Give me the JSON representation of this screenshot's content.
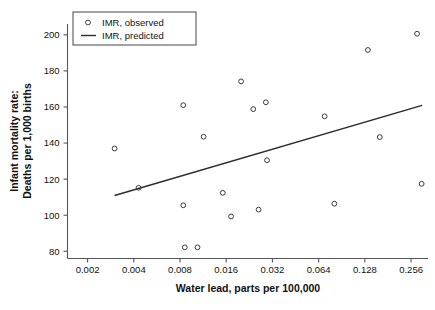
{
  "chart_data": {
    "type": "scatter",
    "title": "",
    "xlabel": "Water lead, parts per 100,000",
    "ylabel": "Infant mortality rate:\nDeaths per 1,000 births",
    "ylabel_line1": "Infant mortality rate:",
    "ylabel_line2": "Deaths per 1,000 births",
    "xscale": "log2",
    "xlim": [
      0.00148,
      0.33
    ],
    "ylim": [
      76,
      206
    ],
    "xticks": [
      0.002,
      0.004,
      0.008,
      0.016,
      0.032,
      0.064,
      0.128,
      0.256
    ],
    "xtick_labels": [
      "0.002",
      "0.004",
      "0.008",
      "0.016",
      "0.032",
      "0.064",
      "0.128",
      "0.256"
    ],
    "yticks": [
      80,
      100,
      120,
      140,
      160,
      180,
      200
    ],
    "ytick_labels": [
      "80",
      "100",
      "120",
      "140",
      "160",
      "180",
      "200"
    ],
    "grid": false,
    "legend_position": "top-left",
    "legend": [
      {
        "label": "IMR, observed",
        "marker": "circle"
      },
      {
        "label": "IMR, predicted",
        "marker": "line"
      }
    ],
    "series": [
      {
        "name": "IMR, observed",
        "marker": "open-circle",
        "color": "#3a3a44",
        "points": [
          {
            "x": 0.003,
            "y": 137.0
          },
          {
            "x": 0.0043,
            "y": 115.2
          },
          {
            "x": 0.0084,
            "y": 161.0
          },
          {
            "x": 0.0084,
            "y": 105.5
          },
          {
            "x": 0.0086,
            "y": 82.2
          },
          {
            "x": 0.0104,
            "y": 82.2
          },
          {
            "x": 0.0114,
            "y": 143.5
          },
          {
            "x": 0.0152,
            "y": 112.4
          },
          {
            "x": 0.0172,
            "y": 99.3
          },
          {
            "x": 0.02,
            "y": 174.2
          },
          {
            "x": 0.024,
            "y": 158.8
          },
          {
            "x": 0.026,
            "y": 103.1
          },
          {
            "x": 0.029,
            "y": 162.6
          },
          {
            "x": 0.0295,
            "y": 130.5
          },
          {
            "x": 0.07,
            "y": 154.8
          },
          {
            "x": 0.081,
            "y": 106.4
          },
          {
            "x": 0.134,
            "y": 191.6
          },
          {
            "x": 0.16,
            "y": 143.3
          },
          {
            "x": 0.28,
            "y": 200.6
          },
          {
            "x": 0.3,
            "y": 117.4
          }
        ]
      },
      {
        "name": "IMR, predicted",
        "marker": "line",
        "color": "#2a2a33",
        "line": {
          "x_start": 0.003,
          "y_start": 110.9,
          "x_end": 0.302,
          "y_end": 160.9
        }
      }
    ]
  }
}
